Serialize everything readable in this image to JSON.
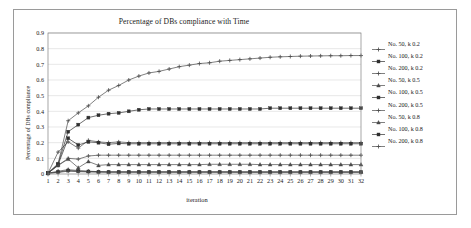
{
  "chart_data": {
    "type": "line",
    "title": "Percentage of DBs compliance with Time",
    "xlabel": "iteration",
    "ylabel": "Percentage of DBs compliance",
    "xlim": [
      1,
      32
    ],
    "ylim": [
      0,
      0.9
    ],
    "ytick_labels": [
      "0.9",
      "0.8",
      "0.7",
      "0.6",
      "0.5",
      "0.4",
      "0.3",
      "0.2",
      "0.1",
      "0"
    ],
    "ytick_values": [
      0.9,
      0.8,
      0.7,
      0.6,
      0.5,
      0.4,
      0.3,
      0.2,
      0.1,
      0
    ],
    "x": [
      1,
      2,
      3,
      4,
      5,
      6,
      7,
      8,
      9,
      10,
      11,
      12,
      13,
      14,
      15,
      16,
      17,
      18,
      19,
      20,
      21,
      22,
      23,
      24,
      25,
      26,
      27,
      28,
      29,
      30,
      31,
      32
    ],
    "categories": [
      "1",
      "2",
      "3",
      "4",
      "5",
      "6",
      "7",
      "8",
      "9",
      "10",
      "11",
      "12",
      "13",
      "14",
      "15",
      "16",
      "17",
      "18",
      "19",
      "20",
      "21",
      "22",
      "23",
      "24",
      "25",
      "26",
      "27",
      "28",
      "29",
      "30",
      "31",
      "32"
    ],
    "grid": true,
    "legend_position": "right",
    "series": [
      {
        "name": "No. 50, k 0.2",
        "marker": "cross",
        "color": "#4a4a4a",
        "values": [
          0.005,
          0.14,
          0.205,
          0.165,
          0.215,
          0.205,
          0.2,
          0.205,
          0.2,
          0.2,
          0.2,
          0.2,
          0.2,
          0.2,
          0.2,
          0.2,
          0.2,
          0.2,
          0.2,
          0.2,
          0.2,
          0.2,
          0.2,
          0.2,
          0.2,
          0.2,
          0.2,
          0.2,
          0.2,
          0.2,
          0.2,
          0.2
        ]
      },
      {
        "name": "No. 100, k 0.2",
        "marker": "square",
        "color": "#2f2f2f",
        "values": [
          0.005,
          0.065,
          0.27,
          0.315,
          0.36,
          0.375,
          0.385,
          0.39,
          0.4,
          0.41,
          0.415,
          0.415,
          0.415,
          0.415,
          0.415,
          0.415,
          0.415,
          0.415,
          0.415,
          0.415,
          0.415,
          0.415,
          0.42,
          0.42,
          0.42,
          0.42,
          0.42,
          0.42,
          0.42,
          0.42,
          0.42,
          0.42
        ]
      },
      {
        "name": "No. 200, k 0.2",
        "marker": "cross",
        "color": "#4a4a4a",
        "values": [
          0.005,
          0.065,
          0.34,
          0.39,
          0.435,
          0.49,
          0.535,
          0.565,
          0.6,
          0.625,
          0.645,
          0.655,
          0.67,
          0.685,
          0.695,
          0.705,
          0.71,
          0.72,
          0.725,
          0.73,
          0.735,
          0.74,
          0.745,
          0.748,
          0.75,
          0.752,
          0.753,
          0.754,
          0.755,
          0.755,
          0.756,
          0.756
        ]
      },
      {
        "name": "No. 50, k 0.5",
        "marker": "triangle",
        "color": "#4a4a4a",
        "values": [
          0.005,
          0.055,
          0.095,
          0.04,
          0.08,
          0.055,
          0.06,
          0.06,
          0.06,
          0.06,
          0.06,
          0.06,
          0.06,
          0.06,
          0.06,
          0.06,
          0.062,
          0.062,
          0.062,
          0.062,
          0.062,
          0.06,
          0.06,
          0.06,
          0.06,
          0.06,
          0.06,
          0.06,
          0.06,
          0.06,
          0.06,
          0.06
        ]
      },
      {
        "name": "No. 100, k 0.5",
        "marker": "square",
        "color": "#2f2f2f",
        "values": [
          0.005,
          0.06,
          0.228,
          0.185,
          0.205,
          0.2,
          0.19,
          0.195,
          0.193,
          0.193,
          0.193,
          0.193,
          0.193,
          0.193,
          0.193,
          0.193,
          0.193,
          0.193,
          0.193,
          0.193,
          0.193,
          0.193,
          0.193,
          0.193,
          0.193,
          0.193,
          0.193,
          0.193,
          0.193,
          0.193,
          0.193,
          0.193
        ]
      },
      {
        "name": "No. 200, k 0.5",
        "marker": "cross",
        "color": "#4a4a4a",
        "values": [
          0.005,
          0.055,
          0.1,
          0.095,
          0.115,
          0.12,
          0.12,
          0.12,
          0.12,
          0.12,
          0.12,
          0.12,
          0.12,
          0.12,
          0.12,
          0.12,
          0.12,
          0.12,
          0.12,
          0.12,
          0.12,
          0.12,
          0.12,
          0.12,
          0.12,
          0.12,
          0.12,
          0.12,
          0.12,
          0.12,
          0.12,
          0.12
        ]
      },
      {
        "name": "No. 50, k 0.8",
        "marker": "triangle",
        "color": "#4a4a4a",
        "values": [
          0.005,
          0.018,
          0.028,
          0.022,
          0.018,
          0.015,
          0.013,
          0.013,
          0.013,
          0.013,
          0.013,
          0.013,
          0.013,
          0.013,
          0.013,
          0.013,
          0.013,
          0.013,
          0.013,
          0.012,
          0.012,
          0.012,
          0.012,
          0.012,
          0.012,
          0.012,
          0.012,
          0.012,
          0.012,
          0.012,
          0.012,
          0.012
        ]
      },
      {
        "name": "No. 100, k 0.8",
        "marker": "square",
        "color": "#2f2f2f",
        "values": [
          0.005,
          0.012,
          0.022,
          0.018,
          0.016,
          0.014,
          0.013,
          0.013,
          0.013,
          0.013,
          0.013,
          0.013,
          0.013,
          0.013,
          0.013,
          0.013,
          0.013,
          0.013,
          0.013,
          0.013,
          0.013,
          0.013,
          0.013,
          0.013,
          0.013,
          0.013,
          0.013,
          0.013,
          0.013,
          0.013,
          0.013,
          0.013
        ]
      },
      {
        "name": "No. 200, k 0.8",
        "marker": "cross",
        "color": "#4a4a4a",
        "values": [
          0.005,
          0.01,
          0.018,
          0.015,
          0.013,
          0.012,
          0.012,
          0.012,
          0.012,
          0.012,
          0.012,
          0.012,
          0.012,
          0.012,
          0.012,
          0.012,
          0.012,
          0.012,
          0.012,
          0.012,
          0.012,
          0.012,
          0.012,
          0.012,
          0.012,
          0.012,
          0.012,
          0.012,
          0.012,
          0.012,
          0.012,
          0.012
        ]
      }
    ]
  },
  "colors": {
    "frame": "#9a9a9a",
    "axis": "#808080",
    "grid": "#d9d9d9",
    "text": "#1a1a1a",
    "plot_bg": "#ffffff"
  }
}
